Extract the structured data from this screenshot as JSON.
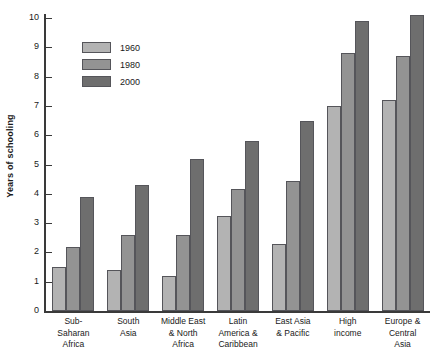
{
  "chart_data": {
    "type": "bar",
    "title": "",
    "xlabel": "",
    "ylabel": "Years of schooling",
    "ylim": [
      0,
      10
    ],
    "ytick_labels": [
      "10",
      "9",
      "8",
      "7",
      "6",
      "5",
      "4",
      "3",
      "2",
      "1",
      "0"
    ],
    "grid": false,
    "legend_position": "top-left",
    "categories": [
      "Sub-\nSaharan\nAfrica",
      "South\nAsia",
      "Middle East\n& North\nAfrica",
      "Latin\nAmerica &\nCaribbean",
      "East Asia\n& Pacific",
      "High\nincome",
      "Europe &\nCentral\nAsia"
    ],
    "series": [
      {
        "name": "1960",
        "color": "#b3b3b3",
        "values": [
          1.5,
          1.4,
          1.2,
          3.25,
          2.3,
          7.0,
          7.2
        ]
      },
      {
        "name": "1980",
        "color": "#939393",
        "values": [
          2.2,
          2.6,
          2.6,
          4.15,
          4.45,
          8.8,
          8.7
        ]
      },
      {
        "name": "2000",
        "color": "#6e6e6e",
        "values": [
          3.9,
          4.3,
          5.2,
          5.8,
          6.5,
          9.9,
          10.1
        ]
      }
    ]
  },
  "colors": {
    "axis": "#3a3a3a",
    "text": "#1a1a1a",
    "bar_outline": "#55555a",
    "background": "#ffffff"
  }
}
